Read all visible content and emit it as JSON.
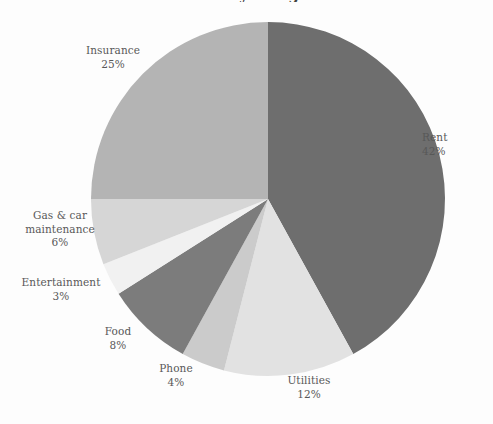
{
  "chart_data": {
    "type": "pie",
    "title": "Monthly Budget",
    "xlabel": "",
    "ylabel": "",
    "legend": "none",
    "grid": false,
    "start_angle_deg": 0,
    "direction": "clockwise",
    "units": "percent",
    "categories": [
      "Rent",
      "Utilities",
      "Phone",
      "Food",
      "Entertainment",
      "Gas & car maintenance",
      "Insurance"
    ],
    "values": [
      42,
      12,
      4,
      8,
      3,
      6,
      25
    ],
    "total": 100,
    "slices": [
      {
        "label": "Rent",
        "value": 42,
        "value_text": "42%",
        "color": "#6e6e6e"
      },
      {
        "label": "Utilities",
        "value": 12,
        "value_text": "12%",
        "color": "#e2e2e2"
      },
      {
        "label": "Phone",
        "value": 4,
        "value_text": "4%",
        "color": "#cbcbcb"
      },
      {
        "label": "Food",
        "value": 8,
        "value_text": "8%",
        "color": "#7c7c7c"
      },
      {
        "label": "Entertainment",
        "value": 3,
        "value_text": "3%",
        "color": "#f1f1f1"
      },
      {
        "label": "Gas & car maintenance",
        "value": 6,
        "value_text": "6%",
        "color": "#d6d6d6"
      },
      {
        "label": "Insurance",
        "value": 25,
        "value_text": "25%",
        "color": "#b4b4b4"
      }
    ]
  },
  "labels": {
    "insurance": {
      "name": "Insurance",
      "pct": "25%"
    },
    "rent": {
      "name": "Rent",
      "pct": "42%"
    },
    "utilities": {
      "name": "Utilities",
      "pct": "12%"
    },
    "phone": {
      "name": "Phone",
      "pct": "4%"
    },
    "food": {
      "name": "Food",
      "pct": "8%"
    },
    "entertainment": {
      "name": "Entertainment",
      "pct": "3%"
    },
    "gascar": {
      "name": "Gas & car maintenance",
      "pct": "6%"
    }
  },
  "colors": {
    "background": "#fdfdfd",
    "text": "#585858",
    "title": "#404040"
  }
}
